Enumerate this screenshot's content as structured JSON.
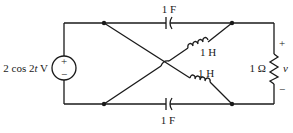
{
  "circuit": {
    "source": {
      "label_prefix": "2 cos 2",
      "label_var": "t",
      "label_suffix": " V",
      "plus": "+",
      "minus": "−"
    },
    "capacitor_top": {
      "label": "1 F"
    },
    "capacitor_bottom": {
      "label": "1 F"
    },
    "inductor_upper": {
      "label": "1 H"
    },
    "inductor_lower": {
      "label": "1 H"
    },
    "resistor": {
      "label": "1 Ω"
    },
    "output": {
      "label": "v",
      "plus": "+",
      "minus": "−"
    }
  }
}
